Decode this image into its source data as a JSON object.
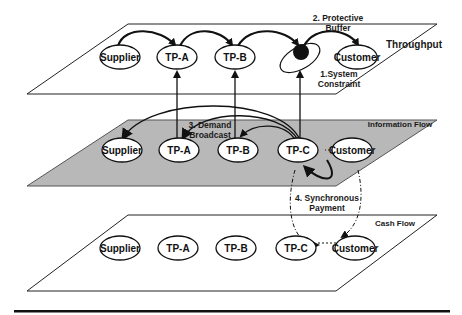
{
  "planes": {
    "top": {
      "label": "Throughput",
      "nodes": [
        "Supplier",
        "TP-A",
        "TP-B",
        "TP-C",
        "Customer"
      ]
    },
    "middle": {
      "label": "Information Flow",
      "nodes": [
        "Supplier",
        "TP-A",
        "TP-B",
        "TP-C",
        "Customer"
      ]
    },
    "bottom": {
      "label": "Cash Flow",
      "nodes": [
        "Supplier",
        "TP-A",
        "TP-B",
        "TP-C",
        "Customer"
      ]
    }
  },
  "annotations": {
    "system_constraint_line1": "1.System",
    "system_constraint_line2": "Constraint",
    "protective_buffer_line1": "2. Protective",
    "protective_buffer_line2": "Buffer",
    "demand_broadcast_line1": "3. Demand",
    "demand_broadcast_line2": "Broadcast",
    "sync_payment_line1": "4. Synchronous",
    "sync_payment_line2": "Payment"
  },
  "colors": {
    "middle_plane_fill": "#b8b8b8",
    "line": "#111111",
    "background": "#ffffff"
  }
}
